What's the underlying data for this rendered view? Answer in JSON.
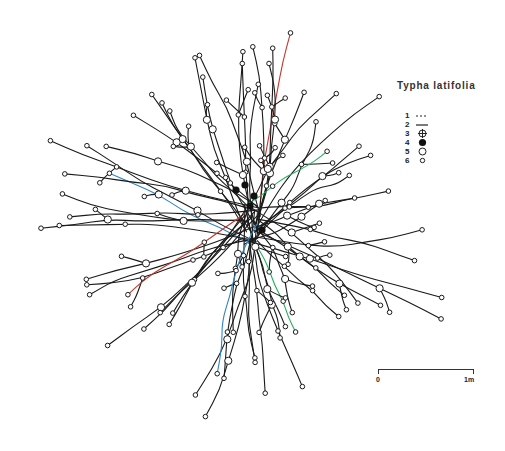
{
  "figure": {
    "species_title": "Typha latifolia",
    "line_color": "#1a1a1a",
    "accent_colors": [
      "#c0392b",
      "#2e86c1",
      "#27ae60"
    ]
  },
  "legend": {
    "items": [
      {
        "number": "1",
        "symbol": "dashed-line"
      },
      {
        "number": "2",
        "symbol": "solid-line"
      },
      {
        "number": "3",
        "symbol": "crossed-circle"
      },
      {
        "number": "4",
        "symbol": "filled-circle"
      },
      {
        "number": "5",
        "symbol": "large-open-circle"
      },
      {
        "number": "6",
        "symbol": "small-open-circle"
      }
    ]
  },
  "scale_bar": {
    "start_label": "0",
    "end_label": "1m"
  },
  "diagram": {
    "center": [
      252,
      225
    ],
    "filled_nodes": [
      [
        245,
        185
      ],
      [
        254,
        196
      ],
      [
        250,
        206
      ],
      [
        262,
        230
      ],
      [
        236,
        190
      ]
    ]
  }
}
